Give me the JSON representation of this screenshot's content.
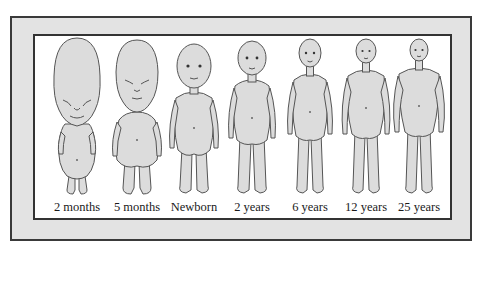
{
  "diagram": {
    "colors": {
      "frame_fill": "#e3e3e3",
      "frame_border": "#3a3a3a",
      "panel_fill": "#ffffff",
      "figure_fill": "#dcdcdc",
      "figure_stroke": "#555555"
    },
    "figures": [
      {
        "label": "2 months",
        "icon": "fetus-2-months-figure"
      },
      {
        "label": "5 months",
        "icon": "fetus-5-months-figure"
      },
      {
        "label": "Newborn",
        "icon": "newborn-figure"
      },
      {
        "label": "2 years",
        "icon": "child-2-years-figure"
      },
      {
        "label": "6 years",
        "icon": "child-6-years-figure"
      },
      {
        "label": "12 years",
        "icon": "child-12-years-figure"
      },
      {
        "label": "25 years",
        "icon": "adult-25-years-figure"
      }
    ]
  }
}
